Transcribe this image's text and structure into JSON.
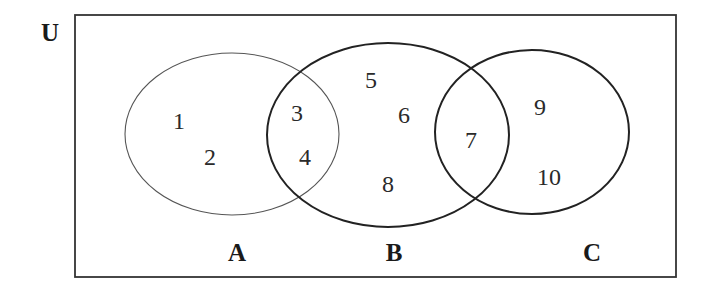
{
  "diagram": {
    "type": "venn",
    "universe": {
      "label": "U",
      "label_pos": [
        50,
        32
      ],
      "rect": {
        "x": 75,
        "y": 15,
        "w": 601,
        "h": 262
      },
      "stroke": "#333333",
      "stroke_width": 1.8
    },
    "sets": [
      {
        "name": "A",
        "label": "A",
        "cx": 232,
        "cy": 134,
        "rx": 107,
        "ry": 81,
        "stroke": "#555555",
        "stroke_width": 1.1,
        "label_pos": [
          237,
          252
        ]
      },
      {
        "name": "B",
        "label": "B",
        "cx": 388,
        "cy": 135,
        "rx": 121,
        "ry": 92,
        "stroke": "#222222",
        "stroke_width": 2.0,
        "label_pos": [
          394,
          252
        ]
      },
      {
        "name": "C",
        "label": "C",
        "cx": 532,
        "cy": 132,
        "rx": 97,
        "ry": 82,
        "stroke": "#222222",
        "stroke_width": 2.0,
        "label_pos": [
          592,
          252
        ]
      }
    ],
    "elements": [
      {
        "value": "1",
        "x": 179,
        "y": 121,
        "region": "A only"
      },
      {
        "value": "2",
        "x": 210,
        "y": 157,
        "region": "A only"
      },
      {
        "value": "3",
        "x": 297,
        "y": 113,
        "region": "A ∩ B"
      },
      {
        "value": "4",
        "x": 305,
        "y": 157,
        "region": "A ∩ B"
      },
      {
        "value": "5",
        "x": 371,
        "y": 80,
        "region": "B only"
      },
      {
        "value": "6",
        "x": 404,
        "y": 115,
        "region": "B only"
      },
      {
        "value": "7",
        "x": 471,
        "y": 140,
        "region": "B ∩ C"
      },
      {
        "value": "8",
        "x": 388,
        "y": 184,
        "region": "B only"
      },
      {
        "value": "9",
        "x": 540,
        "y": 107,
        "region": "C only"
      },
      {
        "value": "10",
        "x": 549,
        "y": 177,
        "region": "C only"
      }
    ]
  }
}
